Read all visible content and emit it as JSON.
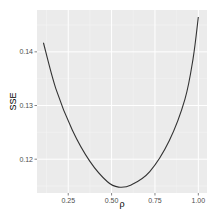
{
  "chart_data": {
    "type": "line",
    "title": "",
    "xlabel": "ρ",
    "ylabel": "SSE",
    "xlim": [
      0.07,
      1.05
    ],
    "ylim": [
      0.1137,
      0.1478
    ],
    "x_ticks": [
      0.25,
      0.5,
      0.75,
      1.0
    ],
    "x_tick_labels": [
      "0.25",
      "0.50",
      "0.75",
      "1.00"
    ],
    "y_ticks": [
      0.12,
      0.13,
      0.14
    ],
    "y_tick_labels": [
      "0.12",
      "0.13",
      "0.14"
    ],
    "grid": true,
    "legend": "none",
    "series": [
      {
        "name": "SSE",
        "color": "#333333",
        "x": [
          0.107,
          0.179,
          0.274,
          0.375,
          0.476,
          0.54,
          0.613,
          0.72,
          0.833,
          0.923,
          0.97,
          1.0
        ],
        "y": [
          0.1417,
          0.1331,
          0.1254,
          0.1196,
          0.1158,
          0.1148,
          0.1152,
          0.1177,
          0.1235,
          0.1312,
          0.1388,
          0.1465
        ]
      }
    ]
  },
  "colors": {
    "panel_background": "#EBEBEB",
    "grid_major": "#FFFFFF",
    "grid_minor": "#F5F5F5",
    "line": "#333333",
    "tick_text": "#4D4D4D",
    "axis_title": "#000000"
  },
  "layout": {
    "panel": {
      "left": 37,
      "top": 10,
      "right": 207,
      "bottom": 193
    }
  }
}
